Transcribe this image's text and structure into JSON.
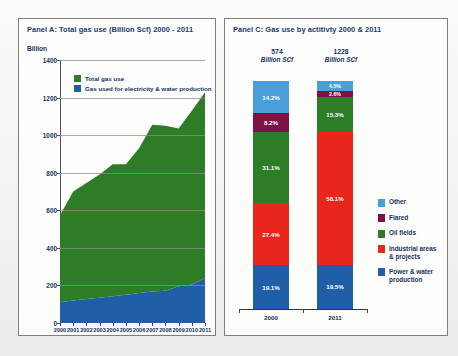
{
  "panel_a": {
    "title": "Panel A: Total gas use (Billion Scf) 2000 - 2011",
    "unit_label": "Billion",
    "legend": [
      {
        "label": "Total gas use",
        "color": "#2d7d27"
      },
      {
        "label": "Gas used for electricity & water production",
        "color": "#1f5fa8"
      }
    ]
  },
  "panel_c": {
    "title": "Panel C: Gas use by actitivty 2000 & 2011",
    "headers": [
      {
        "value": "574",
        "unit": "Billion SCf"
      },
      {
        "value": "1228",
        "unit": "Billion SCf"
      }
    ],
    "legend": [
      {
        "label": "Other",
        "color": "#4a9fd8"
      },
      {
        "label": "Flared",
        "color": "#7b1243"
      },
      {
        "label": "Oil fields",
        "color": "#2d7d27"
      },
      {
        "label": "Industrial areas & projects",
        "color": "#e8261b"
      },
      {
        "label": "Power & water production",
        "color": "#1f5fa8"
      }
    ]
  },
  "chart_data": [
    {
      "type": "area",
      "title": "Panel A: Total gas use (Billion Scf) 2000 - 2011",
      "xlabel": "",
      "ylabel": "Billion",
      "ylim": [
        0,
        1400
      ],
      "yticks": [
        0,
        200,
        400,
        600,
        800,
        1000,
        1200,
        1400
      ],
      "grid": true,
      "legend_position": "inside-top",
      "x": [
        "2000",
        "2001",
        "2002",
        "2003",
        "2004",
        "2005",
        "2006",
        "2007",
        "2008",
        "2009",
        "2010",
        "2011"
      ],
      "series": [
        {
          "name": "Total gas use",
          "color": "#2d7d27",
          "values": [
            574,
            700,
            745,
            790,
            845,
            845,
            930,
            1055,
            1050,
            1035,
            1130,
            1228
          ]
        },
        {
          "name": "Gas used for electricity & water production",
          "color": "#1f5fa8",
          "values": [
            110,
            120,
            128,
            135,
            142,
            150,
            160,
            168,
            172,
            196,
            205,
            240
          ]
        }
      ]
    },
    {
      "type": "bar",
      "stacked": true,
      "title": "Panel C: Gas use by actitivty 2000 & 2011",
      "xlabel": "",
      "ylabel": "",
      "ylim": [
        0,
        100
      ],
      "categories": [
        "2000",
        "2011"
      ],
      "category_totals": [
        "574 Billion SCf",
        "1228 Billion SCf"
      ],
      "legend_position": "right",
      "series": [
        {
          "name": "Other",
          "color": "#4a9fd8",
          "values": [
            14.2,
            4.5
          ],
          "labels": [
            "14.2%",
            "4.5%"
          ]
        },
        {
          "name": "Flared",
          "color": "#7b1243",
          "values": [
            8.2,
            2.6
          ],
          "labels": [
            "8.2%",
            "2.6%"
          ]
        },
        {
          "name": "Oil fields",
          "color": "#2d7d27",
          "values": [
            31.1,
            15.3
          ],
          "labels": [
            "31.1%",
            "15.3%"
          ]
        },
        {
          "name": "Industrial areas & projects",
          "color": "#e8261b",
          "values": [
            27.4,
            58.1
          ],
          "labels": [
            "27.4%",
            "58.1%"
          ]
        },
        {
          "name": "Power & water production",
          "color": "#1f5fa8",
          "values": [
            19.1,
            19.5
          ],
          "labels": [
            "19.1%",
            "19.5%"
          ]
        }
      ]
    }
  ]
}
